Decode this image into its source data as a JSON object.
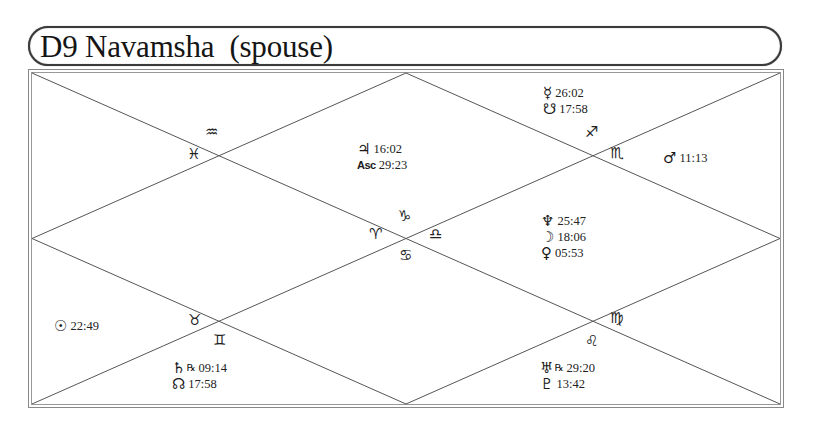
{
  "title": "D9 Navamsha  (spouse)",
  "chart_type": "North Indian diamond chart",
  "signs": {
    "aquarius": "♒",
    "pisces": "♓",
    "sagittarius": "♐",
    "scorpio": "♏",
    "capricorn": "♑",
    "aries": "♈",
    "libra": "♎",
    "cancer": "♋",
    "taurus": "♉",
    "gemini": "♊",
    "virgo": "♍",
    "leo": "♌"
  },
  "houses": {
    "h1": {
      "planets": [
        {
          "glyph": "♃",
          "name": "Jupiter",
          "value": "16:02"
        },
        {
          "glyph": "Asc",
          "name": "Ascendant",
          "value": "29:23"
        }
      ]
    },
    "h2": {
      "planets": [
        {
          "glyph": "☿",
          "name": "Mercury",
          "value": "26:02"
        },
        {
          "glyph": "☋",
          "name": "Ketu",
          "value": "17:58"
        }
      ]
    },
    "h3": {
      "planets": [
        {
          "glyph": "♂",
          "name": "Mars",
          "value": "11:13"
        }
      ]
    },
    "h4": {
      "planets": [
        {
          "glyph": "♆",
          "name": "Neptune",
          "value": "25:47"
        },
        {
          "glyph": "☽",
          "name": "Moon",
          "value": "18:06"
        },
        {
          "glyph": "♀",
          "name": "Venus",
          "value": "05:53"
        }
      ]
    },
    "h6": {
      "planets": [
        {
          "glyph": "♅",
          "name": "Uranus",
          "retro": "℞",
          "value": "29:20"
        },
        {
          "glyph": "♇",
          "name": "Pluto",
          "value": "13:42"
        }
      ]
    },
    "h8": {
      "planets": [
        {
          "glyph": "♄",
          "name": "Saturn",
          "retro": "℞",
          "value": "09:14"
        },
        {
          "glyph": "☊",
          "name": "Rahu",
          "value": "17:58"
        }
      ]
    },
    "h9": {
      "planets": [
        {
          "glyph": "☉",
          "name": "Sun",
          "value": "22:49"
        }
      ]
    }
  },
  "colors": {
    "line": "#555555",
    "frame": "#3a3a3a",
    "text": "#111111"
  }
}
